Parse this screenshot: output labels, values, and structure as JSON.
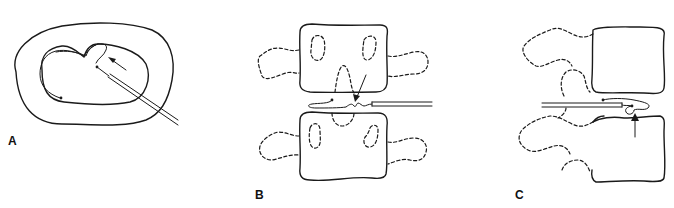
{
  "figure": {
    "panels": [
      {
        "id": "A",
        "label": "A",
        "view": "axial",
        "elements": [
          "annulus-outer-contour",
          "nucleus-inner-contour",
          "needle",
          "catheter-loop",
          "arrow"
        ]
      },
      {
        "id": "B",
        "label": "B",
        "view": "anteroposterior",
        "elements": [
          "upper-vertebral-body",
          "lower-vertebral-body",
          "pedicles-dashed",
          "transverse-processes-dashed",
          "needle",
          "catheter",
          "arrow"
        ]
      },
      {
        "id": "C",
        "label": "C",
        "view": "lateral",
        "elements": [
          "upper-vertebral-body",
          "lower-vertebral-body",
          "posterior-elements-dashed",
          "needle",
          "catheter",
          "arrow"
        ]
      }
    ],
    "colors": {
      "line": "#1a1a1a",
      "background": "#ffffff"
    }
  }
}
